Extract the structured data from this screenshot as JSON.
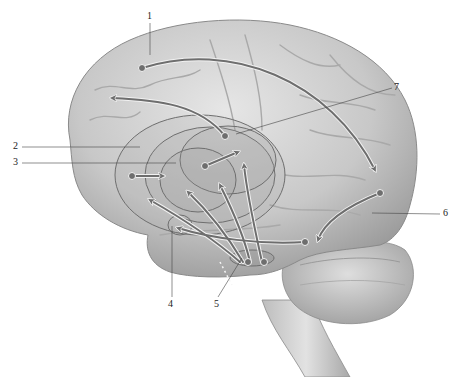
{
  "diagram": {
    "labels": [
      {
        "id": "1",
        "text": "1",
        "x": 147,
        "y": 18
      },
      {
        "id": "2",
        "text": "2",
        "x": 14,
        "y": 145
      },
      {
        "id": "3",
        "text": "3",
        "x": 14,
        "y": 162
      },
      {
        "id": "4",
        "text": "4",
        "x": 169,
        "y": 302
      },
      {
        "id": "5",
        "text": "5",
        "x": 215,
        "y": 302
      },
      {
        "id": "6",
        "text": "6",
        "x": 444,
        "y": 212
      },
      {
        "id": "7",
        "text": "7",
        "x": 395,
        "y": 87
      }
    ],
    "colors": {
      "brain_light": "#dcdcdc",
      "brain_mid": "#b9b9b9",
      "brain_dark": "#8e8e8e",
      "arrow": "#6e6e6e",
      "arrow_outline": "#f2f2f2",
      "leader_line": "#444444",
      "background": "#ffffff"
    }
  }
}
